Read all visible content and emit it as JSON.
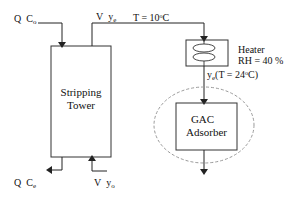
{
  "diagram": {
    "inlet_liquid": {
      "flow": "Q",
      "conc": "C",
      "conc_sub": "o"
    },
    "outlet_liquid": {
      "flow": "Q",
      "conc": "C",
      "conc_sub": "e"
    },
    "outlet_gas": {
      "flow": "V",
      "conc": "y",
      "conc_sub": "e",
      "temp_label": "T = 10",
      "temp_unit": "C",
      "degree": "o"
    },
    "inlet_gas": {
      "flow": "V",
      "conc": "y",
      "conc_sub": "o"
    },
    "tower": {
      "line1": "Stripping",
      "line2": "Tower"
    },
    "heater": {
      "name": "Heater",
      "rh": "RH = 40 %"
    },
    "heated_gas": {
      "conc": "y",
      "conc_sub": "e",
      "temp_label": "(T = 24",
      "temp_unit": "C)",
      "degree": "o"
    },
    "adsorber": {
      "line1": "GAC",
      "line2": "Adsorber"
    },
    "colors": {
      "line": "#222222",
      "dashed": "#9a9a9a"
    }
  }
}
